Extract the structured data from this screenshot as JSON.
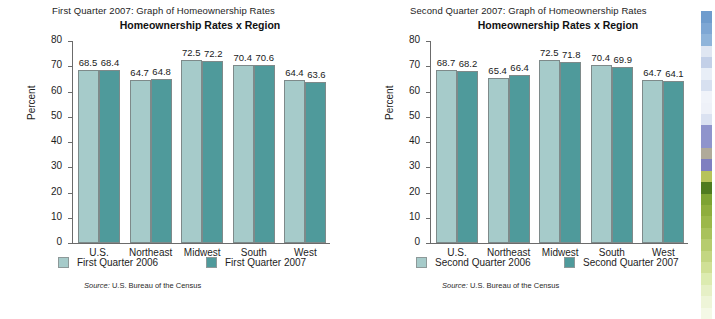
{
  "panels": [
    {
      "caption": "First Quarter 2007: Graph of Homeownership Rates",
      "title": "Homeownership Rates x Region",
      "ylabel": "Percent",
      "source_prefix": "Source:",
      "source_text": " U.S. Bureau of the Census",
      "legend": [
        {
          "label": "First Quarter 2006",
          "color": "#a6cbca"
        },
        {
          "label": "First Quarter 2007",
          "color": "#4f9a9b"
        }
      ]
    },
    {
      "caption": "Second Quarter 2007: Graph of Homeownership Rates",
      "title": "Homeownership Rates x Region",
      "ylabel": "Percent",
      "source_prefix": "Source:",
      "source_text": " U.S. Bureau of the Census",
      "legend": [
        {
          "label": "Second Quarter 2006",
          "color": "#a6cbca"
        },
        {
          "label": "Second Quarter 2007",
          "color": "#4f9a9b"
        }
      ]
    }
  ],
  "yticks": [
    "80",
    "70",
    "60",
    "50",
    "40",
    "30",
    "20",
    "10",
    "0"
  ],
  "chart_data": [
    {
      "type": "bar",
      "title": "Homeownership Rates x Region",
      "subtitle": "First Quarter 2007: Graph of Homeownership Rates",
      "xlabel": "",
      "ylabel": "Percent",
      "ylim": [
        0,
        80
      ],
      "ytick_step": 10,
      "grid": false,
      "legend_position": "bottom",
      "categories": [
        "U.S.",
        "Northeast",
        "Midwest",
        "South",
        "West"
      ],
      "series": [
        {
          "name": "First Quarter 2006",
          "color": "#a6cbca",
          "values": [
            68.5,
            64.7,
            72.5,
            70.4,
            64.4
          ]
        },
        {
          "name": "First Quarter 2007",
          "color": "#4f9a9b",
          "values": [
            68.4,
            64.8,
            72.2,
            70.6,
            63.6
          ]
        }
      ],
      "annotations": [
        "Source: U.S. Bureau of the Census"
      ]
    },
    {
      "type": "bar",
      "title": "Homeownership Rates x Region",
      "subtitle": "Second Quarter 2007: Graph of Homeownership Rates",
      "xlabel": "",
      "ylabel": "Percent",
      "ylim": [
        0,
        80
      ],
      "ytick_step": 10,
      "grid": false,
      "legend_position": "bottom",
      "categories": [
        "U.S.",
        "Northeast",
        "Midwest",
        "South",
        "West"
      ],
      "series": [
        {
          "name": "Second Quarter 2006",
          "color": "#a6cbca",
          "values": [
            68.7,
            65.4,
            72.5,
            70.4,
            64.7
          ]
        },
        {
          "name": "Second Quarter 2007",
          "color": "#4f9a9b",
          "values": [
            68.2,
            66.4,
            71.8,
            69.9,
            64.1
          ]
        }
      ],
      "annotations": [
        "Source: U.S. Bureau of the Census"
      ]
    }
  ],
  "edge_strip": {
    "colors": [
      "#ffffff",
      "#6f9ccd",
      "#7ea7d4",
      "#8fb4da",
      "#dfe6f2",
      "#c3d0e8",
      "#e8eef7",
      "#d7e0f0",
      "#f0f3f9",
      "#eef1f8",
      "#dbe2f1",
      "#8f94cc",
      "#8f94cc",
      "#b0aa9a",
      "#7f7fc0",
      "#b7c35a",
      "#4f7b1f",
      "#7ea332",
      "#8fae3d",
      "#9cb84a",
      "#a9c25c",
      "#b6cc6e",
      "#c3d682",
      "#d0e096",
      "#dcebb0",
      "#e6f0c6",
      "#eef5d8",
      "#f4f9e6"
    ]
  }
}
